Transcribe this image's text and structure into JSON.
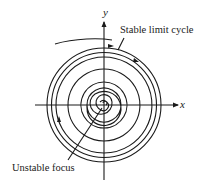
{
  "diagram": {
    "type": "phase-portrait",
    "axes": {
      "x_label": "x",
      "y_label": "y"
    },
    "annotations": {
      "limit_cycle": "Stable limit cycle",
      "focus": "Unstable focus"
    },
    "colors": {
      "ink": "#1a1a1a",
      "background": "#ffffff"
    }
  }
}
